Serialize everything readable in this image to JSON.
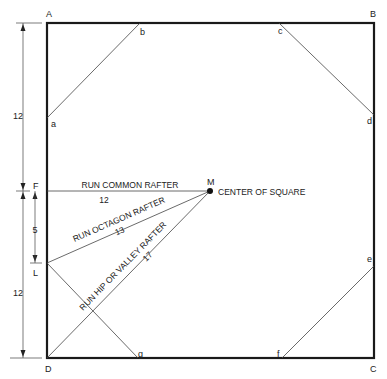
{
  "corners": {
    "A": "A",
    "B": "B",
    "C": "C",
    "D": "D"
  },
  "points": {
    "a": "a",
    "b": "b",
    "c": "c",
    "d": "d",
    "e": "e",
    "f": "f",
    "g": "g",
    "F": "F",
    "L": "L",
    "M": "M"
  },
  "dimensions": {
    "top": "12",
    "middle": "5",
    "bottom": "12"
  },
  "rafters": {
    "common": {
      "label": "RUN COMMON RAFTER",
      "value": "12"
    },
    "octagon": {
      "label": "RUN OCTAGON RAFTER",
      "value": "13"
    },
    "hip": {
      "label": "RUN HIP OR VALLEY RAFTER",
      "value": "17"
    }
  },
  "center_label": "CENTER OF SQUARE",
  "colors": {
    "line": "#1a1a1a",
    "thin": "#444444"
  }
}
